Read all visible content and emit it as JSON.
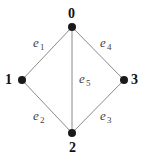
{
  "graph": {
    "nodes": [
      {
        "id": "0",
        "label": "0"
      },
      {
        "id": "1",
        "label": "1"
      },
      {
        "id": "2",
        "label": "2"
      },
      {
        "id": "3",
        "label": "3"
      }
    ],
    "edges": [
      {
        "id": "e1",
        "from": "0",
        "to": "1",
        "label": "e",
        "sub": "1"
      },
      {
        "id": "e2",
        "from": "1",
        "to": "2",
        "label": "e",
        "sub": "2"
      },
      {
        "id": "e3",
        "from": "2",
        "to": "3",
        "label": "e",
        "sub": "3"
      },
      {
        "id": "e4",
        "from": "0",
        "to": "3",
        "label": "e",
        "sub": "4"
      },
      {
        "id": "e5",
        "from": "0",
        "to": "2",
        "label": "e",
        "sub": "5"
      }
    ]
  }
}
